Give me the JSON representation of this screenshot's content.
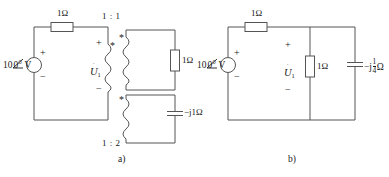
{
  "figure": {
    "panels": [
      {
        "id": "a",
        "caption": "a)",
        "source": {
          "magnitude": "10",
          "angle": "0°",
          "unit": "V",
          "plus": "+",
          "minus": "−"
        },
        "series_resistor": "1Ω",
        "voltage_label": {
          "symbol": "U",
          "subscript": "1",
          "plus": "+",
          "minus": "−"
        },
        "transformer_top": {
          "ratio": "1 : 1",
          "dot_primary": "*",
          "dot_secondary": "*",
          "load": "1Ω"
        },
        "transformer_bottom": {
          "ratio": "1 : 2",
          "dot_secondary": "*",
          "load": "−j1Ω"
        }
      },
      {
        "id": "b",
        "caption": "b)",
        "source": {
          "magnitude": "10",
          "angle": "0°",
          "unit": "V",
          "plus": "+",
          "minus": "−"
        },
        "series_resistor": "1Ω",
        "voltage_label": {
          "symbol": "U",
          "subscript": "1",
          "plus": "+",
          "minus": "−"
        },
        "shunt_resistor": "1Ω",
        "capacitor": {
          "prefix": "−j",
          "num": "1",
          "den": "4",
          "unit": "Ω"
        }
      }
    ],
    "colors": {
      "wire": "#555555",
      "text": "#1a1a1a",
      "background": "#ffffff"
    }
  }
}
